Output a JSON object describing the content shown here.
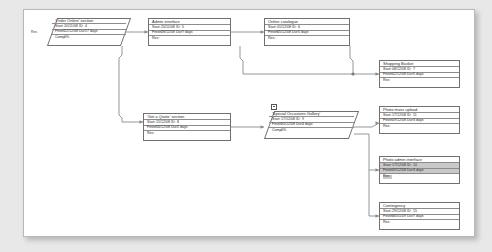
{
  "diagram": {
    "type": "project-network-chart",
    "page_background": "#e8e8e8",
    "canvas_background": "#ffffff",
    "border_color": "#707070",
    "highlight_color": "#c9c9c9",
    "field_labels": {
      "start": "Start:",
      "finish": "Finish:",
      "id": "ID:",
      "dur": "Dur:",
      "comp": "Comp:",
      "res": "Res:"
    }
  },
  "nodes": [
    {
      "key": "order_online",
      "name": "'Order Online' section",
      "shape": "parallelogram",
      "start": "20/11/08",
      "id": "4",
      "finish": "12/12/08",
      "dur": "17 days",
      "comp": "0%",
      "res": "",
      "side_tag": "Res"
    },
    {
      "key": "admin_interface",
      "name": "Admin interface",
      "shape": "rect",
      "start": "20/11/08",
      "id": "5",
      "finish": "28/11/08",
      "dur": "7 days",
      "res": ""
    },
    {
      "key": "online_catalogue",
      "name": "Online catalogue",
      "shape": "rect",
      "start": "01/12/08",
      "id": "6",
      "finish": "05/12/08",
      "dur": "5 days",
      "res": ""
    },
    {
      "key": "shopping_basket",
      "name": "Shopping Basket",
      "shape": "rect",
      "start": "08/12/08",
      "id": "7",
      "finish": "12/12/08",
      "dur": "5 days",
      "res": ""
    },
    {
      "key": "get_a_quote",
      "name": "'Get a Quote' section",
      "shape": "rect",
      "start": "15/12/08",
      "id": "8",
      "finish": "16/12/08",
      "dur": "2 days",
      "res": ""
    },
    {
      "key": "special_occasions_gallery",
      "name": "'Special Occasions Gallery'",
      "shape": "parallelogram",
      "start": "17/12/08",
      "id": "9",
      "finish": "20/12/08",
      "dur": "4 days",
      "comp": "0%",
      "res": ""
    },
    {
      "key": "photo_mass_upload",
      "name": "Photo mass upload",
      "shape": "rect",
      "start": "17/12/08",
      "id": "11",
      "finish": "19/12/08",
      "dur": "3 days",
      "res": ""
    },
    {
      "key": "photo_admin_interface",
      "name": "Photo admin interface",
      "shape": "rect",
      "selected": true,
      "start": "17/12/08",
      "id": "10",
      "finish": "19/12/08",
      "dur": "3 days",
      "res": ""
    },
    {
      "key": "contingency",
      "name": "Contingency",
      "shape": "rect",
      "start": "29/12/08",
      "id": "15",
      "finish": "06/01/09",
      "dur": "7 days",
      "res": ""
    }
  ]
}
